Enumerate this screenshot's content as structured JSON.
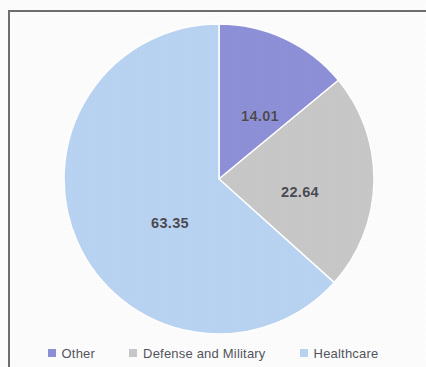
{
  "chart_data": {
    "type": "pie",
    "title": "",
    "categories": [
      "Other",
      "Defense and Military",
      "Healthcare"
    ],
    "values": [
      14.01,
      22.64,
      63.35
    ],
    "labels": [
      "14.01",
      "22.64",
      "63.35"
    ],
    "colors": [
      "#8e90d8",
      "#c8c8c8",
      "#b9d3f2"
    ],
    "legend_position": "bottom",
    "grid": false,
    "start_angle_deg": 0,
    "direction": "clockwise"
  },
  "chart": {
    "slices": [
      {
        "name": "Other",
        "label": "14.01",
        "value": 14.01,
        "color": "#8e90d8"
      },
      {
        "name": "Defense and Military",
        "label": "22.64",
        "value": 22.64,
        "color": "#c8c8c8"
      },
      {
        "name": "Healthcare",
        "label": "63.35",
        "value": 63.35,
        "color": "#b9d3f2"
      }
    ]
  },
  "legend": {
    "items": [
      {
        "label": "Other",
        "color": "#8e90d8"
      },
      {
        "label": "Defense and Military",
        "color": "#c8c8c8"
      },
      {
        "label": "Healthcare",
        "color": "#b9d3f2"
      }
    ]
  }
}
